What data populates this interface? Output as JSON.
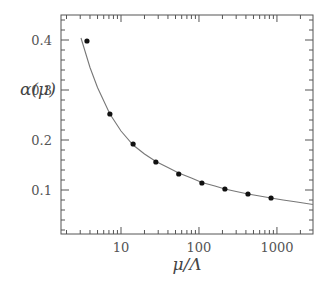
{
  "chart_data": {
    "type": "scatter",
    "title": "",
    "xlabel": "μ/Λ",
    "ylabel": "α(μ)",
    "xscale": "log",
    "xlim": [
      1.7,
      2900
    ],
    "ylim": [
      0.012,
      0.45
    ],
    "grid": false,
    "legend": null,
    "x_ticks": [
      10,
      100,
      1000
    ],
    "x_tick_labels": [
      "10",
      "100",
      "1000"
    ],
    "y_ticks": [
      0.1,
      0.2,
      0.3,
      0.4
    ],
    "y_tick_labels": [
      "0.1",
      "0.2",
      "0.3",
      "0.4"
    ],
    "series": [
      {
        "name": "data points",
        "kind": "scatter",
        "x": [
          3.66,
          7.2,
          14.3,
          28,
          55,
          109,
          215,
          425,
          840
        ],
        "y": [
          0.398,
          0.252,
          0.192,
          0.156,
          0.132,
          0.114,
          0.102,
          0.092,
          0.084
        ]
      },
      {
        "name": "fit curve",
        "kind": "line",
        "x": [
          3.07,
          4,
          5,
          7.2,
          10,
          14.3,
          20,
          28,
          40,
          55,
          80,
          109,
          160,
          215,
          300,
          425,
          600,
          840,
          1200,
          1800,
          2900
        ],
        "y": [
          0.404,
          0.345,
          0.305,
          0.252,
          0.218,
          0.19,
          0.172,
          0.157,
          0.145,
          0.134,
          0.124,
          0.115,
          0.108,
          0.102,
          0.097,
          0.092,
          0.088,
          0.084,
          0.08,
          0.076,
          0.071
        ]
      }
    ]
  }
}
